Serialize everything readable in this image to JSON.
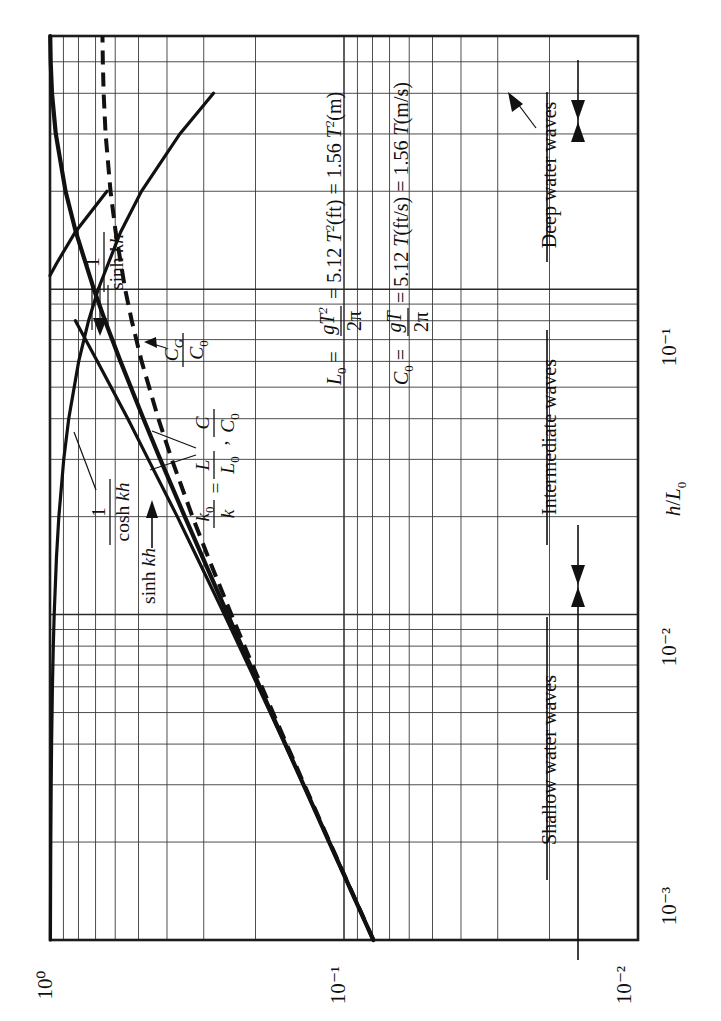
{
  "figure": {
    "kind": "log-log nomograph",
    "orientation": "rotated 90 degrees counter-clockwise"
  },
  "axes": {
    "x_label": "h/L₀",
    "x_ticks": [
      "10⁻³",
      "10⁻²",
      "10⁻¹"
    ],
    "y_ticks": [
      "10⁻²",
      "10⁻¹",
      "10⁰"
    ]
  },
  "curve_labels": {
    "sinh_inv": "1 / sinh kh",
    "cosh_inv": "1 / cosh kh",
    "sinh": "sinh kh",
    "cg_c0": "C_G / C₀",
    "ratio": "k₀/k = L/L₀ , C/C₀"
  },
  "curve_label_parts": {
    "one": "1",
    "sinh_kh": "sinh kh",
    "cosh_kh": "cosh kh",
    "sinh_plain": "sinh",
    "kh": "kh",
    "CG": "C",
    "CG_sub": "G",
    "C0": "C",
    "C0_sub": "0",
    "k0": "k",
    "k0_sub": "0",
    "k": "k",
    "eq": "=",
    "L": "L",
    "L0": "L",
    "L0_sub": "0",
    "comma": ",",
    "C": "C"
  },
  "equations": {
    "L0": {
      "lhs": "L",
      "lhs_sub": "0",
      "eq1": "=",
      "num": "gT",
      "num_sup": "2",
      "den": "2π",
      "eq2": "= 5.12",
      "t1": "T",
      "t1_sup": "2",
      "u1": "(ft)",
      "eq3": "= 1.56",
      "t2": "T",
      "t2_sup": "2",
      "u2": "(m)",
      "plain": "L₀ = gT²/2π = 5.12 T²(ft) = 1.56 T²(m)"
    },
    "C0": {
      "lhs": "C",
      "lhs_sub": "0",
      "eq1": "=",
      "num": "gT",
      "den": "2π",
      "eq2": "= 5.12",
      "t1": "T",
      "u1": "(ft/s)",
      "eq3": "= 1.56",
      "t2": "T",
      "u2": "(m/s)",
      "plain": "C₀ = gT/2π = 5.12 T(ft/s) = 1.56 T(m/s)"
    }
  },
  "regions": [
    {
      "name": "shallow",
      "label": "Shallow water waves"
    },
    {
      "name": "intermediate",
      "label": "Intermediate waves"
    },
    {
      "name": "deep",
      "label": "Deep water waves"
    }
  ],
  "colors": {
    "ink": "#111111",
    "grid_major": "#2a2a2a",
    "grid_minor": "#3a3a3a",
    "paper": "#ffffff"
  },
  "chart_data": {
    "type": "line",
    "title": "",
    "xlabel": "h/L₀",
    "ylabel": "",
    "xlim": [
      0.001,
      0.6
    ],
    "ylim": [
      0.01,
      1.0
    ],
    "xscale": "log",
    "yscale": "log",
    "grid": true,
    "legend": "inline curve labels",
    "x_tick_values": [
      0.001,
      0.01,
      0.1
    ],
    "y_tick_values": [
      0.01,
      0.1,
      1.0
    ],
    "annotations": [
      "Shallow water waves",
      "Intermediate waves",
      "Deep water waves",
      "L₀ = gT²/2π = 5.12 T²(ft) = 1.56 T²(m)",
      "C₀ = gT/2π = 5.12 T(ft/s) = 1.56 T(m/s)"
    ],
    "region_bounds": {
      "shallow_max": 0.04,
      "deep_min": 0.5
    },
    "series": [
      {
        "name": "k₀/k = L/L₀ = C/C₀",
        "style": "solid",
        "x": [
          0.001,
          0.0015,
          0.002,
          0.003,
          0.004,
          0.006,
          0.008,
          0.01,
          0.015,
          0.02,
          0.03,
          0.04,
          0.06,
          0.08,
          0.1,
          0.15,
          0.2,
          0.3,
          0.4,
          0.5,
          0.6
        ],
        "y": [
          0.0795,
          0.0973,
          0.1123,
          0.1373,
          0.1583,
          0.1934,
          0.2228,
          0.2485,
          0.3026,
          0.3479,
          0.4215,
          0.481,
          0.5757,
          0.6497,
          0.7094,
          0.8167,
          0.8854,
          0.9557,
          0.9846,
          0.9948,
          0.9983
        ]
      },
      {
        "name": "C_G/C₀",
        "style": "dashed",
        "x": [
          0.001,
          0.0015,
          0.002,
          0.003,
          0.004,
          0.006,
          0.008,
          0.01,
          0.015,
          0.02,
          0.03,
          0.04,
          0.06,
          0.08,
          0.1,
          0.15,
          0.2,
          0.3,
          0.4,
          0.5,
          0.6
        ],
        "y": [
          0.0794,
          0.0971,
          0.1119,
          0.1364,
          0.1568,
          0.1903,
          0.218,
          0.2416,
          0.2896,
          0.3276,
          0.3853,
          0.4281,
          0.4879,
          0.5272,
          0.5551,
          0.598,
          0.6225,
          0.647,
          0.657,
          0.6612,
          0.663
        ]
      },
      {
        "name": "1 / sinh kh",
        "style": "solid",
        "x": [
          0.001,
          0.0015,
          0.002,
          0.003,
          0.004,
          0.006,
          0.008,
          0.01,
          0.015,
          0.02,
          0.03,
          0.04,
          0.06,
          0.08,
          0.1,
          0.12,
          0.15,
          0.2
        ],
        "y": [
          12.6,
          10.3,
          8.92,
          7.28,
          6.29,
          5.11,
          4.4,
          3.92,
          3.16,
          2.71,
          2.16,
          1.84,
          1.45,
          1.22,
          1.06,
          0.95,
          0.82,
          0.64
        ]
      },
      {
        "name": "1 / cosh kh",
        "style": "solid",
        "x": [
          0.001,
          0.0015,
          0.002,
          0.003,
          0.004,
          0.006,
          0.008,
          0.01,
          0.015,
          0.02,
          0.03,
          0.04,
          0.06,
          0.08,
          0.1,
          0.15,
          0.2,
          0.3,
          0.4
        ],
        "y": [
          0.9969,
          0.9953,
          0.9938,
          0.9907,
          0.9876,
          0.9812,
          0.9745,
          0.9678,
          0.9506,
          0.933,
          0.8979,
          0.8636,
          0.7987,
          0.7393,
          0.6856,
          0.5749,
          0.4886,
          0.3617,
          0.2779
        ]
      },
      {
        "name": "sinh kh",
        "style": "solid",
        "x": [
          0.001,
          0.0015,
          0.002,
          0.003,
          0.004,
          0.006,
          0.008,
          0.01,
          0.015,
          0.02,
          0.03,
          0.04,
          0.06,
          0.08
        ],
        "y": [
          0.0794,
          0.0971,
          0.1121,
          0.1374,
          0.159,
          0.1957,
          0.2273,
          0.2551,
          0.3164,
          0.369,
          0.463,
          0.5435,
          0.6897,
          0.8197
        ]
      }
    ]
  }
}
